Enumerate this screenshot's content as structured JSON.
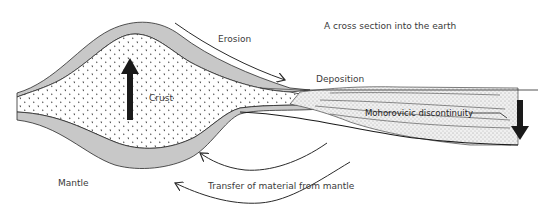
{
  "title": "A cross section into the earth",
  "labels": {
    "erosion": "Erosion",
    "deposition": "Deposition",
    "crust": "Crust",
    "moho": "Mohorovicic discontinuity",
    "mantle": "Mantle",
    "transfer": "Transfer of material from mantle"
  },
  "colors": {
    "outline": "#2a2a2a",
    "mantle_band": "#c8c8c8",
    "crust_fill": "#ffffff",
    "sediment_fill": "#e6e6e6",
    "arrow": "#1a1a1a",
    "text": "#3a3a3a"
  },
  "arrows": [
    {
      "name": "uplift-arrow",
      "direction": "up"
    },
    {
      "name": "subsidence-arrow",
      "direction": "down"
    },
    {
      "name": "erosion-arrow",
      "direction": "right-down"
    },
    {
      "name": "mantle-transfer-arrow-upper",
      "direction": "left"
    },
    {
      "name": "mantle-transfer-arrow-lower",
      "direction": "left"
    }
  ]
}
